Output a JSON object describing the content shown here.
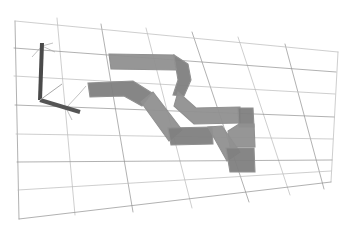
{
  "viewport": {
    "width": 345,
    "height": 237,
    "background_color": "#ffffff",
    "title": "3D Trajectory Viewport",
    "render_style": "perspective-wireframe"
  },
  "ground_grid": {
    "name": "ground-plane-grid",
    "line_color": "#b9b9b9",
    "line_color_strong": "#8f8f8f",
    "line_width": 0.7,
    "rows": 7,
    "cols": 8,
    "corners": {
      "top_left": [
        15,
        21
      ],
      "top_right": [
        338,
        52
      ],
      "bottom_right": [
        331,
        182
      ],
      "bottom_left": [
        19,
        219
      ]
    },
    "u_lines": [
      [
        [
          15,
          21
        ],
        [
          19,
          219
        ]
      ],
      [
        [
          57,
          18
        ],
        [
          75,
          215
        ]
      ],
      [
        [
          101,
          24
        ],
        [
          133,
          212
        ]
      ],
      [
        [
          146,
          28
        ],
        [
          192,
          208
        ]
      ],
      [
        [
          192,
          32
        ],
        [
          249,
          202
        ]
      ],
      [
        [
          238,
          37
        ],
        [
          290,
          195
        ]
      ],
      [
        [
          285,
          44
        ],
        [
          324,
          189
        ]
      ],
      [
        [
          338,
          52
        ],
        [
          331,
          182
        ]
      ]
    ],
    "v_lines": [
      [
        [
          15,
          21
        ],
        [
          338,
          52
        ]
      ],
      [
        [
          14,
          48
        ],
        [
          336,
          72
        ]
      ],
      [
        [
          14,
          76
        ],
        [
          335,
          94
        ]
      ],
      [
        [
          15,
          105
        ],
        [
          334,
          117
        ]
      ],
      [
        [
          16,
          134
        ],
        [
          333,
          139
        ]
      ],
      [
        [
          17,
          162
        ],
        [
          332,
          160
        ]
      ],
      [
        [
          18,
          190
        ],
        [
          331,
          171
        ]
      ],
      [
        [
          19,
          219
        ],
        [
          331,
          182
        ]
      ]
    ]
  },
  "axis_gizmo": {
    "name": "coordinate-axis-gizmo",
    "origin": [
      40,
      100
    ],
    "bar_color": "#555555",
    "bar_color_dark": "#4a4a4a",
    "thin_line_color": "#a8a8a8",
    "z_axis": {
      "label": "z",
      "from": [
        40,
        100
      ],
      "to": [
        42,
        43
      ]
    },
    "x_axis": {
      "label": "x",
      "from": [
        40,
        100
      ],
      "to": [
        80,
        112
      ]
    },
    "y_axis": {
      "label": "y",
      "from": [
        40,
        100
      ],
      "to": [
        62,
        84
      ]
    },
    "thin_rays": [
      [
        [
          42,
          46
        ],
        [
          55,
          52
        ]
      ],
      [
        [
          42,
          46
        ],
        [
          32,
          57
        ]
      ],
      [
        [
          42,
          46
        ],
        [
          53,
          43
        ]
      ],
      [
        [
          40,
          100
        ],
        [
          72,
          109
        ]
      ],
      [
        [
          66,
          108
        ],
        [
          80,
          93
        ]
      ],
      [
        [
          66,
          108
        ],
        [
          72,
          120
        ]
      ],
      [
        [
          80,
          93
        ],
        [
          86,
          86
        ]
      ]
    ]
  },
  "trajectory_ribbon": {
    "name": "trajectory-sweep-ribbon",
    "fill_color": "#909090",
    "fill_color_shade": "#7f7f7f",
    "edge_color": "#6e6e6e",
    "opacity": 0.95,
    "description": "Swept band showing a meandering 3D path across the ground plane",
    "outline_points": [
      [
        109,
        54
      ],
      [
        172,
        55
      ],
      [
        186,
        63
      ],
      [
        190,
        77
      ],
      [
        184,
        90
      ],
      [
        181,
        104
      ],
      [
        196,
        110
      ],
      [
        210,
        110
      ],
      [
        238,
        109
      ],
      [
        239,
        125
      ],
      [
        250,
        126
      ],
      [
        252,
        146
      ],
      [
        229,
        147
      ],
      [
        222,
        131
      ],
      [
        208,
        130
      ],
      [
        197,
        141
      ],
      [
        174,
        145
      ],
      [
        160,
        135
      ],
      [
        149,
        121
      ],
      [
        143,
        109
      ],
      [
        124,
        96
      ],
      [
        95,
        96
      ],
      [
        89,
        84
      ],
      [
        132,
        82
      ],
      [
        151,
        89
      ],
      [
        160,
        72
      ],
      [
        168,
        68
      ],
      [
        166,
        68
      ],
      [
        153,
        69
      ],
      [
        120,
        69
      ],
      [
        109,
        66
      ]
    ],
    "segments": [
      {
        "name": "upper-horizontal-bar",
        "points": [
          [
            109,
            54
          ],
          [
            174,
            55
          ],
          [
            176,
            70
          ],
          [
            111,
            69
          ]
        ]
      },
      {
        "name": "right-descend-curve",
        "points": [
          [
            174,
            55
          ],
          [
            188,
            64
          ],
          [
            191,
            80
          ],
          [
            184,
            96
          ],
          [
            173,
            95
          ],
          [
            178,
            80
          ],
          [
            176,
            68
          ]
        ]
      },
      {
        "name": "mid-right-horizontal",
        "points": [
          [
            178,
            92
          ],
          [
            196,
            108
          ],
          [
            240,
            107
          ],
          [
            240,
            123
          ],
          [
            194,
            124
          ],
          [
            174,
            106
          ]
        ]
      },
      {
        "name": "right-step-down",
        "points": [
          [
            238,
            108
          ],
          [
            253,
            108
          ],
          [
            254,
            127
          ],
          [
            239,
            127
          ]
        ]
      },
      {
        "name": "right-end-pad",
        "points": [
          [
            239,
            124
          ],
          [
            254,
            124
          ],
          [
            255,
            147
          ],
          [
            230,
            147
          ],
          [
            228,
            131
          ]
        ]
      },
      {
        "name": "left-horizontal-bar",
        "points": [
          [
            88,
            83
          ],
          [
            133,
            81
          ],
          [
            152,
            93
          ],
          [
            142,
            106
          ],
          [
            124,
            96
          ],
          [
            90,
            97
          ]
        ]
      },
      {
        "name": "mid-diagonal",
        "points": [
          [
            141,
            102
          ],
          [
            153,
            92
          ],
          [
            182,
            130
          ],
          [
            169,
            141
          ]
        ]
      },
      {
        "name": "lower-horizontal",
        "points": [
          [
            168,
            128
          ],
          [
            212,
            127
          ],
          [
            213,
            144
          ],
          [
            171,
            145
          ]
        ]
      },
      {
        "name": "lower-diagonal",
        "points": [
          [
            208,
            127
          ],
          [
            222,
            126
          ],
          [
            240,
            152
          ],
          [
            227,
            161
          ]
        ]
      },
      {
        "name": "lower-end-pad",
        "points": [
          [
            226,
            148
          ],
          [
            254,
            148
          ],
          [
            255,
            172
          ],
          [
            230,
            172
          ]
        ]
      }
    ]
  },
  "legend": {
    "grid_label": "ground grid",
    "path_label": "swept trajectory",
    "axis_label": "world frame"
  }
}
